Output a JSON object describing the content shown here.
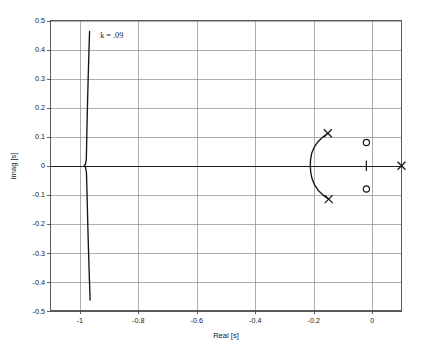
{
  "figure": {
    "background": "#ffffff",
    "plot_background": "#ffffff",
    "grid_color": "#8c8c8c",
    "line_color": "#161616"
  },
  "chart_data": {
    "type": "line",
    "title": "",
    "subtitle": "",
    "xlabel": "Real [s]",
    "ylabel": "Imag [s]",
    "xlim": [
      -1.1,
      0.1
    ],
    "ylim": [
      -0.5,
      0.5
    ],
    "xticks": [
      -1,
      -0.8,
      -0.6,
      -0.4,
      -0.2,
      0
    ],
    "xtick_labels": [
      "-1",
      "-0.8",
      "-0.6",
      "-0.4",
      "-0.2",
      "0"
    ],
    "yticks": [
      -0.5,
      -0.4,
      -0.3,
      -0.2,
      -0.1,
      0,
      0.1,
      0.2,
      0.3,
      0.4,
      0.5
    ],
    "ytick_labels": [
      "-0.5",
      "-0.4",
      "-0.3",
      "-0.2",
      "-0.1",
      "0",
      "0.1",
      "0.2",
      "0.3",
      "0.4",
      "0.5"
    ],
    "grid": true,
    "legend": null,
    "legend_position": "none",
    "annotations": [
      {
        "text": "k = .09",
        "x": -0.93,
        "y": 0.44,
        "name": "gain-annotation"
      }
    ],
    "series": [
      {
        "name": "locus-branch-vertical",
        "type": "line",
        "points": [
          [
            -0.9665,
            0.462
          ],
          [
            -0.969,
            0.38
          ],
          [
            -0.9712,
            0.3
          ],
          [
            -0.9733,
            0.22
          ],
          [
            -0.9751,
            0.14
          ],
          [
            -0.9765,
            0.07
          ],
          [
            -0.9775,
            0.024
          ],
          [
            -0.98,
            0.006
          ],
          [
            -0.9845,
            0.0
          ],
          [
            -0.98,
            -0.006
          ],
          [
            -0.977,
            -0.025
          ],
          [
            -0.9755,
            -0.08
          ],
          [
            -0.9738,
            -0.15
          ],
          [
            -0.9718,
            -0.23
          ],
          [
            -0.9695,
            -0.31
          ],
          [
            -0.967,
            -0.39
          ],
          [
            -0.9645,
            -0.462
          ]
        ]
      },
      {
        "name": "locus-branch-arc",
        "type": "line",
        "points": [
          [
            -0.152,
            0.112
          ],
          [
            -0.17,
            0.098
          ],
          [
            -0.186,
            0.082
          ],
          [
            -0.1985,
            0.064
          ],
          [
            -0.207,
            0.043
          ],
          [
            -0.211,
            0.02
          ],
          [
            -0.2118,
            0.0
          ],
          [
            -0.2105,
            -0.021
          ],
          [
            -0.206,
            -0.044
          ],
          [
            -0.197,
            -0.066
          ],
          [
            -0.1845,
            -0.085
          ],
          [
            -0.168,
            -0.101
          ],
          [
            -0.149,
            -0.115
          ]
        ]
      }
    ],
    "markers": [
      {
        "name": "open-loop-pole",
        "symbol": "x",
        "x": -0.152,
        "y": 0.112
      },
      {
        "name": "open-loop-pole",
        "symbol": "x",
        "x": -0.149,
        "y": -0.115
      },
      {
        "name": "open-loop-pole",
        "symbol": "x",
        "x": 0.1,
        "y": 0.0
      },
      {
        "name": "open-loop-zero",
        "symbol": "o",
        "x": -0.02,
        "y": 0.08
      },
      {
        "name": "open-loop-zero",
        "symbol": "o",
        "x": -0.02,
        "y": -0.08
      },
      {
        "name": "real-axis-tick",
        "symbol": "|",
        "x": -0.02,
        "y": 0.0
      }
    ]
  }
}
